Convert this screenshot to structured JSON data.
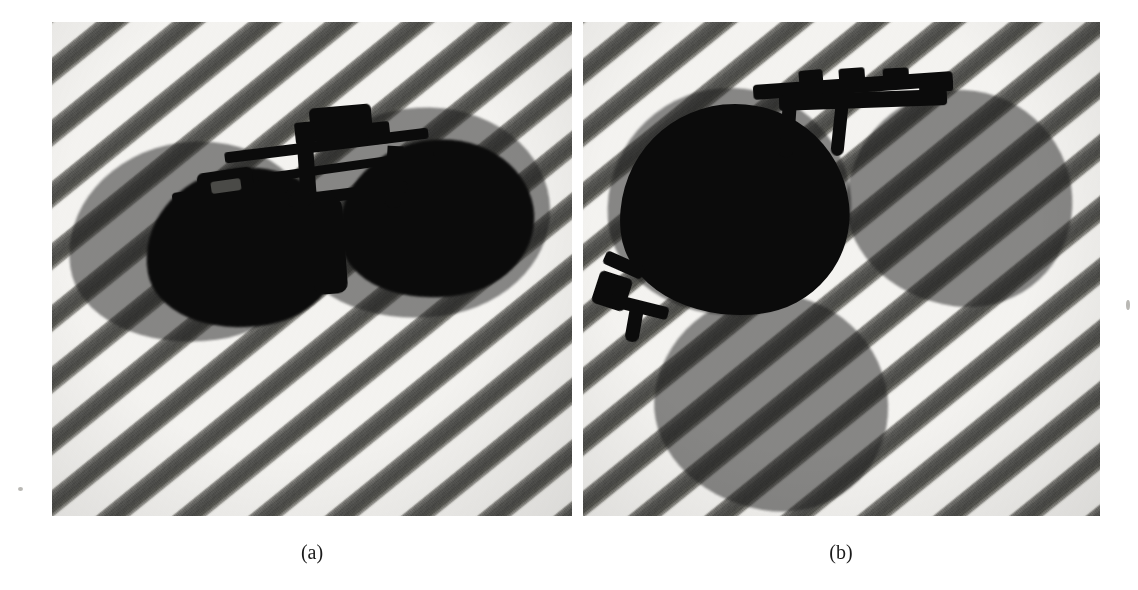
{
  "figure": {
    "background_color": "#ffffff",
    "panel_count": 2,
    "panels": [
      {
        "id": "panel-a",
        "caption": "(a)",
        "subject": "clip-on polarized sunglasses photographed on a diagonally striped fabric",
        "orientation": "frame viewed near head-on, both lenses side by side, temples/clip arms pointing up",
        "background_pattern": "diagonal stripes",
        "stripe_angle_deg": 141,
        "stripe_period_px": 48,
        "stripe_dark_color": "#4a4a47",
        "stripe_light_color": "#f4f3f0",
        "lens_color": "#0b0b0b",
        "lens_shadow_color": "rgba(25,25,25,0.50)",
        "bounds": {
          "x": 52,
          "y": 22,
          "width": 520,
          "height": 494
        },
        "lens_shadows": [
          {
            "name": "left-lens-shadow",
            "x": 16,
            "y": 120,
            "width": 250,
            "height": 200,
            "rotate": -8
          },
          {
            "name": "right-lens-shadow",
            "x": 236,
            "y": 86,
            "width": 262,
            "height": 210,
            "rotate": -8
          }
        ],
        "lenses": [
          {
            "name": "left-lens",
            "x": 93,
            "y": 146,
            "width": 196,
            "height": 160,
            "rotate": -10
          },
          {
            "name": "right-lens",
            "x": 286,
            "y": 118,
            "width": 196,
            "height": 158,
            "rotate": -10
          }
        ]
      },
      {
        "id": "panel-b",
        "caption": "(b)",
        "subject": "the same clip-on sunglasses rotated, one lens nearly face-on and dark, the other folded back",
        "orientation": "frame rotated roughly 60 degrees, near lens fully dark, far lens and shadow offset",
        "background_pattern": "diagonal stripes",
        "stripe_angle_deg": 141,
        "stripe_period_px": 48,
        "stripe_dark_color": "#4a4a47",
        "stripe_light_color": "#f4f3f0",
        "lens_color": "#0b0b0b",
        "lens_shadow_color": "rgba(25,25,25,0.50)",
        "bounds": {
          "x": 583,
          "y": 22,
          "width": 517,
          "height": 494
        },
        "lens_shadows": [
          {
            "name": "upper-right-lens-shadow",
            "x": 264,
            "y": 68,
            "width": 226,
            "height": 216,
            "rotate": 8
          },
          {
            "name": "lower-left-lens-shadow",
            "x": 72,
            "y": 272,
            "width": 234,
            "height": 216,
            "rotate": 10
          },
          {
            "name": "near-lens-shadow",
            "x": 24,
            "y": 66,
            "width": 244,
            "height": 228,
            "rotate": -4
          }
        ],
        "lenses": [
          {
            "name": "near-dark-lens",
            "x": 36,
            "y": 82,
            "width": 230,
            "height": 212,
            "rotate": -6
          }
        ]
      }
    ]
  },
  "captions": {
    "panel_a_label": "(a)",
    "panel_b_label": "(b)",
    "panel_a_center_x": 312,
    "panel_b_center_x": 841,
    "baseline_y": 555
  },
  "colors": {
    "page_background": "#ffffff",
    "stripe_light": "#f4f3f0",
    "stripe_dark": "#4a4a47",
    "lens_black": "#0b0b0b",
    "frame_black": "#0a0a0a",
    "caption_text": "#1a1a1a"
  }
}
